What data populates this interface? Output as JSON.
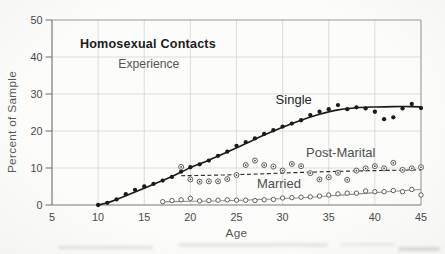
{
  "figure": {
    "kind": "scanned statistical figure",
    "title_line1": "Homosexual Contacts",
    "title_line2": "Experience"
  },
  "colors": {
    "paper": "#fbfbf9",
    "ink": "#1a1a1a",
    "gray_ink": "#4e4e4e",
    "marker_gray": "#565656",
    "grid": "#d4d4d1",
    "frame": "#999996",
    "axis": "#787876",
    "tick_text": "#474745",
    "axis_label": "#565654"
  },
  "chart_data": {
    "type": "scatter",
    "title": "Homosexual Contacts",
    "subtitle": "Experience",
    "xlabel": "Age",
    "ylabel": "Percent of Sample",
    "xlim": [
      5,
      45
    ],
    "ylim": [
      0,
      50
    ],
    "x_ticks": [
      5,
      10,
      15,
      20,
      25,
      30,
      35,
      40,
      45
    ],
    "y_ticks": [
      0,
      10,
      20,
      30,
      40,
      50
    ],
    "grid": true,
    "legend_position": "inline-labels",
    "series": [
      {
        "name": "Single",
        "marker": "filled-dot",
        "line": "solid-bold",
        "x": [
          10,
          11,
          12,
          13,
          14,
          15,
          16,
          17,
          18,
          19,
          20,
          21,
          22,
          23,
          24,
          25,
          26,
          27,
          28,
          29,
          30,
          31,
          32,
          33,
          34,
          35,
          36,
          37,
          38,
          39,
          40,
          41,
          42,
          43,
          44,
          45
        ],
        "y": [
          0,
          0.6,
          1.5,
          2.9,
          4.1,
          5.0,
          5.7,
          6.6,
          7.6,
          9.0,
          10.2,
          11.0,
          12.0,
          13.3,
          14.4,
          16.0,
          17.0,
          18.0,
          19.2,
          20.2,
          21.2,
          22.0,
          22.9,
          24.3,
          25.2,
          25.9,
          27.0,
          25.9,
          26.4,
          26.1,
          25.2,
          23.2,
          23.7,
          26.1,
          27.3,
          26.2
        ],
        "fit": [
          [
            10,
            0
          ],
          [
            11,
            0.6
          ],
          [
            12,
            1.5
          ],
          [
            14,
            3.5
          ],
          [
            16,
            5.6
          ],
          [
            18,
            7.7
          ],
          [
            20,
            10.1
          ],
          [
            22,
            12.1
          ],
          [
            24,
            14.3
          ],
          [
            26,
            16.6
          ],
          [
            28,
            18.9
          ],
          [
            30,
            21.0
          ],
          [
            32,
            22.9
          ],
          [
            34,
            24.5
          ],
          [
            36,
            25.7
          ],
          [
            38,
            26.3
          ],
          [
            40,
            26.5
          ],
          [
            42,
            26.6
          ],
          [
            44,
            26.6
          ],
          [
            45,
            26.5
          ]
        ]
      },
      {
        "name": "Post-Marital",
        "marker": "circled-dot",
        "line": "dashed",
        "x": [
          19,
          20,
          21,
          22,
          23,
          24,
          25,
          26,
          27,
          28,
          29,
          30,
          31,
          32,
          33,
          34,
          35,
          36,
          37,
          38,
          39,
          40,
          41,
          42,
          43,
          44,
          45
        ],
        "y": [
          10.3,
          6.9,
          6.3,
          6.4,
          6.4,
          7.0,
          8.1,
          10.8,
          12.0,
          10.8,
          10.4,
          9.3,
          11.1,
          10.5,
          8.6,
          6.9,
          7.5,
          8.7,
          6.8,
          9.3,
          9.9,
          10.5,
          9.9,
          11.4,
          9.5,
          9.9,
          10.2
        ],
        "fit": [
          [
            19,
            7.9
          ],
          [
            25,
            8.2
          ],
          [
            32,
            8.8
          ],
          [
            38,
            9.2
          ],
          [
            45,
            9.5
          ]
        ]
      },
      {
        "name": "Married",
        "marker": "open-circle",
        "line": "solid-thin",
        "x": [
          17,
          18,
          19,
          20,
          21,
          22,
          23,
          24,
          25,
          26,
          27,
          28,
          29,
          30,
          31,
          32,
          33,
          34,
          35,
          36,
          37,
          38,
          39,
          40,
          41,
          42,
          43,
          44,
          45
        ],
        "y": [
          0.9,
          1.2,
          1.4,
          1.8,
          1.1,
          1.2,
          1.3,
          1.4,
          1.3,
          1.3,
          1.2,
          1.4,
          1.5,
          1.9,
          2.0,
          2.1,
          2.2,
          2.4,
          2.7,
          3.0,
          3.2,
          3.2,
          3.8,
          3.6,
          3.6,
          3.9,
          3.6,
          4.2,
          2.7
        ],
        "fit": [
          [
            17,
            0.85
          ],
          [
            22,
            1.1
          ],
          [
            27,
            1.4
          ],
          [
            32,
            1.95
          ],
          [
            37,
            2.8
          ],
          [
            41,
            3.5
          ],
          [
            45,
            4.2
          ]
        ]
      }
    ],
    "annotations": [
      {
        "text": "Homosexual Contacts",
        "age": 15.4,
        "pct": 42.3,
        "style": "title-bold",
        "name": "chart-title"
      },
      {
        "text": "Experience",
        "age": 15.5,
        "pct": 37.0,
        "style": "title-sub",
        "name": "chart-subtitle"
      },
      {
        "text": "Single",
        "age": 31.2,
        "pct": 27.2,
        "style": "label-dark",
        "name": "series-label-single"
      },
      {
        "text": "Post-Marital",
        "age": 36.3,
        "pct": 12.9,
        "style": "label-gray",
        "name": "series-label-post-marital"
      },
      {
        "text": "Married",
        "age": 29.6,
        "pct": 4.5,
        "style": "label-gray",
        "name": "series-label-married"
      }
    ]
  }
}
